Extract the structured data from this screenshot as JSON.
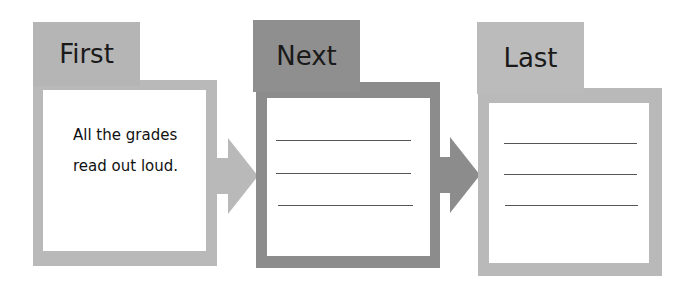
{
  "diagram": {
    "type": "sequence-organizer",
    "colors": {
      "light_gray": "#b9b9b9",
      "dark_gray": "#8c8c8c",
      "line": "#555555"
    },
    "panels": [
      {
        "tab_label": "First",
        "content_lines": [
          "All the grades",
          "read out loud."
        ]
      },
      {
        "tab_label": "Next",
        "content_lines": []
      },
      {
        "tab_label": "Last",
        "content_lines": []
      }
    ]
  }
}
